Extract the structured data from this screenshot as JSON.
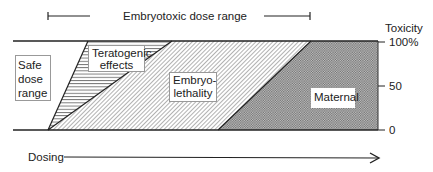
{
  "title": "Embryotoxic dose range",
  "y_axis": {
    "label": "Toxicity",
    "ticks": [
      "100%",
      "50",
      "0"
    ]
  },
  "x_axis": {
    "label": "Dosing"
  },
  "regions": {
    "safe": "Safe dose range",
    "safe_lines": [
      "Safe",
      "dose",
      "range"
    ],
    "teratogenic_lines": [
      "Teratogenic",
      "effects"
    ],
    "embryolethality_lines": [
      "Embryo-",
      "lethality"
    ],
    "maternal": "Maternal"
  },
  "colors": {
    "line": "#222222",
    "hatch": "#555555",
    "maternal_fill": "#9a9a9a"
  }
}
